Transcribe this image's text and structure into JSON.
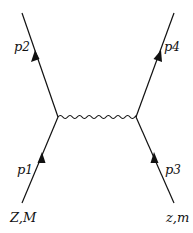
{
  "diagram": {
    "type": "feynman-diagram",
    "lines": {
      "p1": {
        "label": "p",
        "sub": "1"
      },
      "p2": {
        "label": "p",
        "sub": "2"
      },
      "p3": {
        "label": "p",
        "sub": "3"
      },
      "p4": {
        "label": "p",
        "sub": "4"
      }
    },
    "particles": {
      "left": "Z,M",
      "right": "z,m"
    },
    "propagator": "photon",
    "colors": {
      "line": "#111111",
      "background": "#ffffff"
    }
  }
}
